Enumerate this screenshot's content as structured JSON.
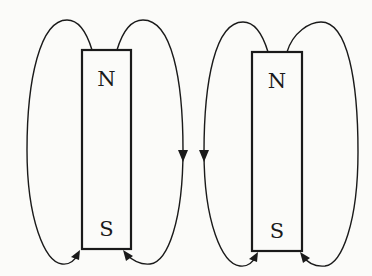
{
  "diagram": {
    "type": "bar-magnet-field-lines",
    "colors": {
      "ink": "#1a1a1a",
      "background": "#fbfbf9"
    },
    "magnets": [
      {
        "id": "left",
        "north_label": "N",
        "south_label": "S"
      },
      {
        "id": "right",
        "north_label": "N",
        "south_label": "S"
      }
    ]
  }
}
